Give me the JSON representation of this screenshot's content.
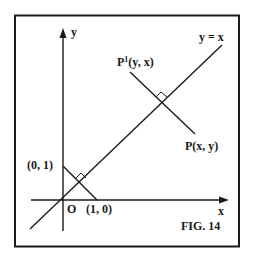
{
  "figure": {
    "caption": "FIG. 14",
    "colors": {
      "background": "#ffffff",
      "ink": "#1a1a1a"
    }
  },
  "axes": {
    "x_label": "x",
    "y_label": "y",
    "origin_label": "O"
  },
  "lines": {
    "diagonal_label": "y = x"
  },
  "points": {
    "p_label": "P(x, y)",
    "p_prime_base": "P",
    "p_prime_sup": "1",
    "p_prime_coords": "(y, x)",
    "point_0_1": "(0, 1)",
    "point_1_0": "(1, 0)"
  }
}
